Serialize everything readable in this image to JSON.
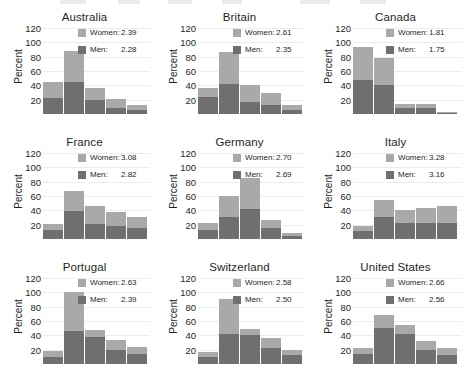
{
  "figure": {
    "ylabel": "Percent",
    "yticks": [
      20,
      40,
      60,
      80,
      100,
      120
    ],
    "ylim": [
      0,
      120
    ],
    "legend_women_label": "Women:",
    "legend_men_label": "Men:",
    "colors": {
      "women": "#a9a9a9",
      "men": "#6f6f6f",
      "gridline": "#ececec",
      "text": "#1f1f1f",
      "background": "#ffffff"
    }
  },
  "chart_data": {
    "type": "bar",
    "title": "",
    "xlabel": "",
    "ylabel": "Percent",
    "ylim": [
      0,
      120
    ],
    "yticks": [
      20,
      40,
      60,
      80,
      100,
      120
    ],
    "grid": true,
    "stacked": true,
    "legend_position": "top-right inside each panel",
    "series_names": [
      "Men",
      "Women"
    ],
    "panels": [
      {
        "title": "Australia",
        "legend": {
          "women": "2.39",
          "men": "2.28"
        },
        "men": [
          22,
          45,
          20,
          9,
          6
        ],
        "women": [
          22,
          43,
          17,
          12,
          6
        ],
        "totals": [
          44,
          88,
          37,
          21,
          12
        ]
      },
      {
        "title": "Britain",
        "legend": {
          "women": "2.61",
          "men": "2.35"
        },
        "men": [
          24,
          42,
          17,
          13,
          6
        ],
        "women": [
          12,
          44,
          24,
          16,
          7
        ],
        "totals": [
          36,
          86,
          41,
          29,
          13
        ]
      },
      {
        "title": "Canada",
        "legend": {
          "women": "1.81",
          "men": "1.75"
        },
        "men": [
          48,
          40,
          8,
          8,
          2
        ],
        "women": [
          46,
          38,
          6,
          6,
          1
        ],
        "totals": [
          94,
          78,
          14,
          14,
          3
        ]
      },
      {
        "title": "France",
        "legend": {
          "women": "3.08",
          "men": "2.82"
        },
        "men": [
          12,
          39,
          21,
          18,
          15
        ],
        "women": [
          9,
          28,
          25,
          20,
          16
        ],
        "totals": [
          21,
          67,
          46,
          38,
          31
        ]
      },
      {
        "title": "Germany",
        "legend": {
          "women": "2.70",
          "men": "2.69"
        },
        "men": [
          12,
          31,
          42,
          16,
          4
        ],
        "women": [
          11,
          29,
          43,
          10,
          4
        ],
        "totals": [
          23,
          60,
          85,
          26,
          8
        ]
      },
      {
        "title": "Italy",
        "legend": {
          "women": "3.28",
          "men": "3.16"
        },
        "men": [
          11,
          31,
          22,
          22,
          23
        ],
        "women": [
          7,
          24,
          19,
          21,
          23
        ],
        "totals": [
          18,
          55,
          41,
          43,
          46
        ]
      },
      {
        "title": "Portugal",
        "legend": {
          "women": "2.63",
          "men": "2.39"
        },
        "men": [
          10,
          46,
          38,
          20,
          14
        ],
        "women": [
          8,
          55,
          10,
          13,
          10
        ],
        "totals": [
          18,
          101,
          48,
          33,
          24
        ]
      },
      {
        "title": "Switzerland",
        "legend": {
          "women": "2.58",
          "men": "2.50"
        },
        "men": [
          10,
          42,
          40,
          22,
          12
        ],
        "women": [
          7,
          49,
          9,
          14,
          8
        ],
        "totals": [
          17,
          91,
          49,
          36,
          20
        ]
      },
      {
        "title": "United States",
        "legend": {
          "women": "2.66",
          "men": "2.56"
        },
        "men": [
          14,
          50,
          42,
          20,
          13
        ],
        "women": [
          9,
          18,
          13,
          12,
          9
        ],
        "totals": [
          23,
          68,
          55,
          32,
          22
        ]
      }
    ]
  }
}
